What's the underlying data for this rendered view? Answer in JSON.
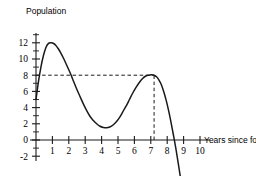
{
  "chart_data": {
    "type": "line",
    "title": "",
    "subtitle": "",
    "xlabel": "Years since founded",
    "ylabel": "Population",
    "xlim": [
      0,
      10.6
    ],
    "ylim": [
      -2.6,
      13.2
    ],
    "grid": false,
    "legend": null,
    "x_ticks": [
      1,
      2,
      3,
      4,
      5,
      6,
      7,
      8,
      9,
      10
    ],
    "x_tick_labels": [
      "1",
      "2",
      "3",
      "4",
      "5",
      "6",
      "7",
      "8",
      "9",
      "10"
    ],
    "y_ticks": [
      -2,
      0,
      2,
      4,
      6,
      8,
      10,
      12
    ],
    "y_tick_labels": [
      "-2",
      "0",
      "2",
      "4",
      "6",
      "8",
      "10",
      "12"
    ],
    "y_minor_ticks": [
      -1,
      1,
      3,
      5,
      7,
      9,
      11,
      13
    ],
    "series": [
      {
        "name": "Population",
        "style": "solid",
        "color": "#1a1a1a",
        "x": [
          0.0,
          0.15,
          0.3,
          0.45,
          0.6,
          0.75,
          0.9,
          1.05,
          1.2,
          1.35,
          1.5,
          1.7,
          1.9,
          2.1,
          2.3,
          2.5,
          2.7,
          2.9,
          3.1,
          3.3,
          3.5,
          3.7,
          3.9,
          4.1,
          4.3,
          4.5,
          4.7,
          4.9,
          5.1,
          5.3,
          5.5,
          5.7,
          5.9,
          6.1,
          6.3,
          6.5,
          6.7,
          6.9,
          7.05,
          7.2,
          7.35,
          7.5,
          7.65,
          7.8,
          7.95,
          8.1,
          8.25,
          8.4,
          8.55,
          8.7,
          8.85,
          9.0
        ],
        "y": [
          5.0,
          7.2,
          9.0,
          10.4,
          11.4,
          11.9,
          12.0,
          11.95,
          11.7,
          11.3,
          10.8,
          10.0,
          9.1,
          8.2,
          7.2,
          6.2,
          5.3,
          4.4,
          3.6,
          2.9,
          2.4,
          2.0,
          1.7,
          1.55,
          1.5,
          1.6,
          1.85,
          2.25,
          2.8,
          3.5,
          4.2,
          5.0,
          5.8,
          6.5,
          7.1,
          7.6,
          7.9,
          8.0,
          8.05,
          8.0,
          7.8,
          7.4,
          6.8,
          5.9,
          4.8,
          3.5,
          2.0,
          0.4,
          -1.3,
          -3.2,
          -5.2,
          -7.4
        ]
      }
    ],
    "annotations": [
      {
        "name": "horizontal-guide",
        "type": "dashed-line",
        "orientation": "horizontal",
        "value": 8,
        "from_x": 0,
        "to_x": 7.2,
        "label": ""
      },
      {
        "name": "vertical-guide",
        "type": "dashed-line",
        "orientation": "vertical",
        "value": 7.2,
        "from_y": 0,
        "to_y": 8,
        "label": ""
      }
    ]
  }
}
